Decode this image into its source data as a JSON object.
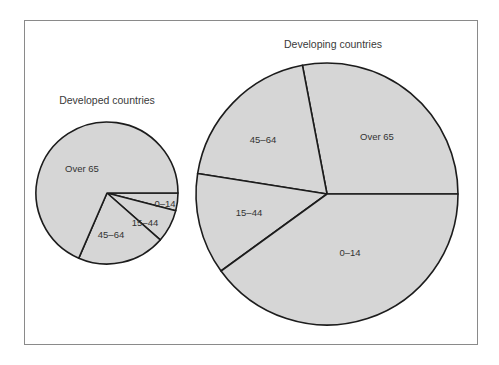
{
  "chart_data": [
    {
      "type": "pie",
      "title": "Developed countries",
      "center": [
        107,
        193
      ],
      "radius": 71,
      "start_angle_deg": 0,
      "direction": "clockwise",
      "categories": [
        "0–14",
        "15–44",
        "45–64",
        "Over 65"
      ],
      "values": [
        4,
        7.5,
        20,
        68.5
      ],
      "label_positions": [
        [
          165,
          207
        ],
        [
          145,
          226
        ],
        [
          111,
          238
        ],
        [
          82,
          172
        ]
      ],
      "fill": "#d6d6d6"
    },
    {
      "type": "pie",
      "title": "Developing countries",
      "center": [
        327,
        194
      ],
      "radius": 131,
      "start_angle_deg": 0,
      "direction": "counterclockwise",
      "categories": [
        "Over 65",
        "45–64",
        "15–44",
        "0–14"
      ],
      "values": [
        28,
        19.5,
        12.5,
        40
      ],
      "label_positions": [
        [
          377,
          140
        ],
        [
          263,
          143
        ],
        [
          249,
          216
        ],
        [
          350,
          256
        ]
      ],
      "fill": "#d6d6d6"
    }
  ],
  "labels": {
    "developed_title": "Developed countries",
    "developing_title": "Developing countries",
    "developed_slices": [
      "0–14",
      "15–44",
      "45–64",
      "Over 65"
    ],
    "developing_slices": [
      "Over 65",
      "45–64",
      "15–44",
      "0–14"
    ]
  },
  "colors": {
    "slice_fill": "#d6d6d6",
    "slice_stroke": "#1c1c1c",
    "frame_border": "#8a8a8a",
    "text": "#333333"
  }
}
